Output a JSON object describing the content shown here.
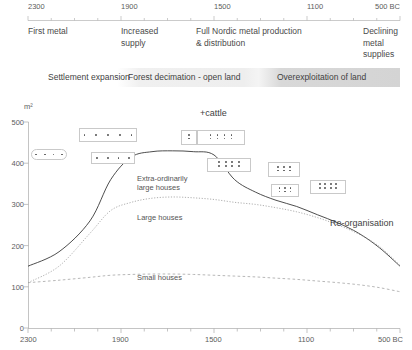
{
  "figure": {
    "top_axis": {
      "ticks": [
        {
          "label": "2300",
          "x": 28
        },
        {
          "label": "1900",
          "x": 121
        },
        {
          "label": "1500",
          "x": 214
        },
        {
          "label": "1100",
          "x": 307
        },
        {
          "label": "500 BC",
          "x": 400
        }
      ]
    },
    "periods": [
      {
        "text": "First metal",
        "x": 28,
        "width": 90
      },
      {
        "text": "Increased\nsupply",
        "x": 121,
        "width": 80
      },
      {
        "text": "Full Nordic metal production\n& distribution",
        "x": 196,
        "width": 160
      },
      {
        "text": "Declining\nmetal\nsupplies",
        "x": 363,
        "width": 48
      }
    ],
    "phases": [
      {
        "label": "Settlement expansion",
        "x": 48
      },
      {
        "label": "Forest decimation - open land",
        "x": 128
      },
      {
        "label": "Overexploitation of land",
        "x": 277
      }
    ],
    "y_axis": {
      "unit": "m²",
      "ticks": [
        "500",
        "400",
        "300",
        "200",
        "100",
        "0"
      ],
      "min": 0,
      "max": 500
    },
    "x_axis": {
      "ticks": [
        {
          "label": "2300",
          "x": 28
        },
        {
          "label": "1900",
          "x": 121
        },
        {
          "label": "1500",
          "x": 214
        },
        {
          "label": "1100",
          "x": 307
        },
        {
          "label": "500 BC",
          "x": 400
        }
      ]
    },
    "curve_labels": [
      {
        "text": "Extra-ordinarily\nlarge houses",
        "x": 137,
        "y": 74
      },
      {
        "text": "Large houses",
        "x": 137,
        "y": 113
      },
      {
        "text": "Small houses",
        "x": 137,
        "y": 173
      }
    ],
    "annotations": [
      {
        "text": "+cattle",
        "x": 200,
        "y": 8
      },
      {
        "text": "Re-organisation",
        "x": 330,
        "y": 118
      }
    ],
    "house_glyphs": [
      {
        "name": "glyph-box-1",
        "x": 31,
        "y": 49,
        "w": 36,
        "h": 11,
        "rounded": true,
        "rows": [
          4
        ]
      },
      {
        "name": "glyph-box-2",
        "x": 79,
        "y": 28,
        "w": 58,
        "h": 14,
        "rounded": false,
        "rows": [
          5
        ]
      },
      {
        "name": "glyph-box-3",
        "x": 91,
        "y": 52,
        "w": 44,
        "h": 12,
        "rounded": false,
        "rows": [
          4
        ]
      },
      {
        "name": "glyph-box-4",
        "x": 181,
        "y": 30,
        "w": 16,
        "h": 15,
        "rounded": false,
        "rows": [
          1,
          1
        ]
      },
      {
        "name": "glyph-box-5",
        "x": 197,
        "y": 30,
        "w": 48,
        "h": 15,
        "rounded": false,
        "rows": [
          4,
          4
        ]
      },
      {
        "name": "glyph-box-6",
        "x": 207,
        "y": 58,
        "w": 44,
        "h": 14,
        "rounded": false,
        "rows": [
          4,
          4
        ]
      },
      {
        "name": "glyph-box-7",
        "x": 268,
        "y": 62,
        "w": 32,
        "h": 15,
        "rounded": false,
        "rows": [
          3,
          3
        ]
      },
      {
        "name": "glyph-box-8",
        "x": 271,
        "y": 84,
        "w": 28,
        "h": 13,
        "rounded": false,
        "rows": [
          3,
          3
        ]
      },
      {
        "name": "glyph-box-9",
        "x": 310,
        "y": 80,
        "w": 36,
        "h": 14,
        "rounded": false,
        "rows": [
          4,
          4
        ]
      }
    ]
  },
  "chart_data": {
    "type": "line",
    "title": "",
    "xlabel": "",
    "ylabel": "m²",
    "xlim": [
      2300,
      500
    ],
    "ylim": [
      0,
      500
    ],
    "grid": false,
    "legend": "inline-labels",
    "x": [
      2300,
      2150,
      2000,
      1900,
      1800,
      1700,
      1600,
      1500,
      1400,
      1300,
      1200,
      1100,
      1000,
      900,
      800,
      700,
      600,
      500
    ],
    "series": [
      {
        "name": "Extra-ordinarily large houses",
        "style": "solid",
        "values": [
          150,
          185,
          260,
          360,
          415,
          428,
          430,
          428,
          420,
          360,
          330,
          310,
          295,
          275,
          255,
          230,
          195,
          150
        ]
      },
      {
        "name": "Large houses",
        "style": "dotted",
        "values": [
          110,
          150,
          230,
          285,
          305,
          315,
          318,
          316,
          312,
          305,
          300,
          292,
          282,
          268,
          250,
          228,
          198,
          152
        ]
      },
      {
        "name": "Small houses",
        "style": "dashed",
        "values": [
          110,
          116,
          123,
          128,
          130,
          131,
          131,
          130,
          128,
          126,
          124,
          121,
          118,
          114,
          110,
          105,
          98,
          88
        ]
      }
    ]
  }
}
